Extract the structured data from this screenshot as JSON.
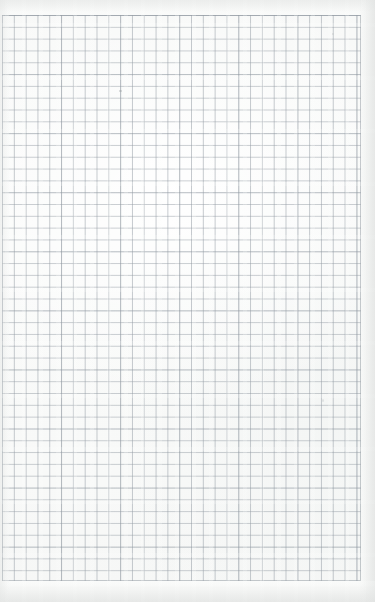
{
  "document": {
    "kind": "graph-paper-scan",
    "description": "Blank square-ruled (graph) paper sheet, scanned",
    "orientation": "portrait",
    "page_width_px": 375,
    "page_height_px": 602,
    "text_content": "",
    "annotations": []
  },
  "paper": {
    "background_color": "#f8f9f8",
    "edge_shadow_color": "#e2e4e3",
    "margins": {
      "top_px": 15,
      "left_px": 2,
      "right_px": 14,
      "bottom_px": 21
    }
  },
  "grid": {
    "label": "square ruling",
    "line_color": "#969ea6",
    "major_line_color": "#8a939c",
    "cell_size_px": 11.82,
    "major_every": 5,
    "origin_x_px": 2,
    "origin_y_px": 15,
    "width_px": 359,
    "height_px": 566,
    "columns": 30,
    "rows": 48,
    "line_width_px": 1,
    "border": "top, right and bottom rule visible; left rule cropped at page edge"
  },
  "artifacts": {
    "vertical_banding": "faint scanner sensor banding",
    "horizontal_streaks": "faint horizontal wash streaks",
    "specks": [
      {
        "name": "pencil-smudge",
        "x_px": 119,
        "y_px": 90
      },
      {
        "name": "paper-speck-top-right",
        "x_px": 332,
        "y_px": 33
      },
      {
        "name": "paper-speck-mid-right",
        "x_px": 322,
        "y_px": 399
      }
    ]
  }
}
